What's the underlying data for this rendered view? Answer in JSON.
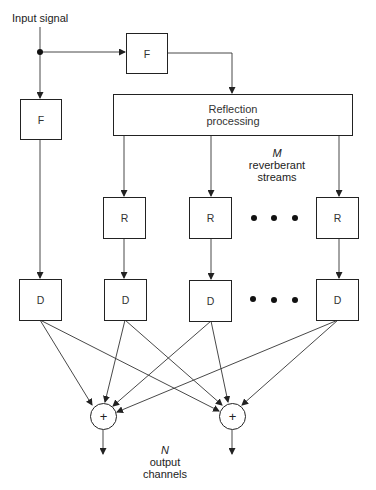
{
  "diagram": {
    "type": "signal-flow block diagram",
    "input_label": "Input signal",
    "direct_filter": {
      "label": "F"
    },
    "reflection_filter": {
      "label": "F"
    },
    "reflection_block": {
      "line1": "Reflection",
      "line2": "processing"
    },
    "streams_annotation": {
      "symbol": "M",
      "line1": "reverberant",
      "line2": "streams"
    },
    "reverb_blocks": [
      {
        "label": "R"
      },
      {
        "label": "R"
      },
      {
        "label": "R"
      }
    ],
    "delay_blocks": [
      {
        "label": "D"
      },
      {
        "label": "D"
      },
      {
        "label": "D"
      },
      {
        "label": "D"
      }
    ],
    "ellipsis_dots": 3,
    "summers": [
      {
        "label": "+"
      },
      {
        "label": "+"
      }
    ],
    "outputs_annotation": {
      "symbol": "N",
      "line1": "output",
      "line2": "channels"
    },
    "colors": {
      "stroke": "#222222",
      "background": "#ffffff"
    }
  }
}
